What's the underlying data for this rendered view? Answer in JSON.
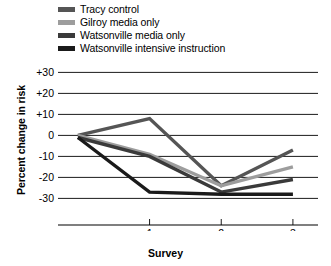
{
  "chart_data": {
    "type": "line",
    "title": "",
    "xlabel": "Survey",
    "ylabel": "Percent change in risk",
    "x": [
      0,
      1,
      2,
      3
    ],
    "xtick_values": [
      1,
      2,
      3
    ],
    "xtick_labels": [
      "1",
      "2",
      "3"
    ],
    "ytick_values": [
      30,
      20,
      10,
      0,
      -10,
      -20,
      -30
    ],
    "ytick_labels": [
      "+30",
      "+20",
      "+10",
      "0",
      "-10",
      "-20",
      "-30"
    ],
    "ylim": [
      -36,
      34
    ],
    "xlim": [
      -0.18,
      3.35
    ],
    "grid": true,
    "grid_axis": "y",
    "legend_position": "above-plot-left",
    "series": [
      {
        "name": "Tracy control",
        "color": "#555555",
        "values": [
          0,
          8,
          -24,
          -7
        ]
      },
      {
        "name": "Gilroy media only",
        "color": "#9d9d9d",
        "values": [
          0,
          -9,
          -24,
          -15
        ]
      },
      {
        "name": "Watsonville media only",
        "color": "#3a3a3a",
        "values": [
          -1,
          -10,
          -27,
          -21
        ]
      },
      {
        "name": "Watsonville intensive instruction",
        "color": "#1a1a1a",
        "values": [
          -1,
          -27,
          -28,
          -28
        ]
      }
    ]
  },
  "legend": {
    "items": [
      {
        "label": "Tracy control",
        "color": "#555555"
      },
      {
        "label": "Gilroy media only",
        "color": "#9d9d9d"
      },
      {
        "label": "Watsonville media only",
        "color": "#3a3a3a"
      },
      {
        "label": "Watsonville intensive instruction",
        "color": "#1a1a1a"
      }
    ]
  },
  "axes": {
    "y_title": "Percent change in risk",
    "x_title": "Survey"
  }
}
